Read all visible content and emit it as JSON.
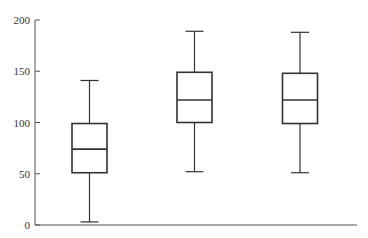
{
  "chart_data": {
    "type": "boxplot",
    "title": "",
    "xlabel": "",
    "ylabel": "",
    "ylim": [
      0,
      200
    ],
    "yticks": [
      0,
      50,
      100,
      150,
      200
    ],
    "ytick_labels": [
      "0",
      "50",
      "100",
      "150",
      "200"
    ],
    "grid": false,
    "legend": null,
    "categories": [
      "",
      "",
      ""
    ],
    "series": [
      {
        "name": "Group 1",
        "min": 3,
        "q1": 51,
        "median": 74,
        "q3": 99,
        "max": 141
      },
      {
        "name": "Group 2",
        "min": 52,
        "q1": 100,
        "median": 122,
        "q3": 149,
        "max": 189
      },
      {
        "name": "Group 3",
        "min": 51,
        "q1": 99,
        "median": 122,
        "q3": 148,
        "max": 188
      }
    ]
  },
  "colors": {
    "box_stroke": "#333333",
    "axis": "#555555",
    "background": "#ffffff"
  }
}
